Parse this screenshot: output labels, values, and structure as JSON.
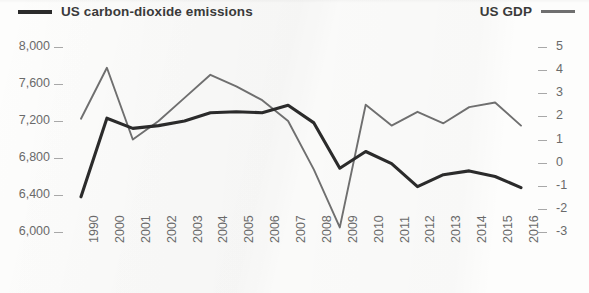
{
  "legend": {
    "left": {
      "label": "US carbon-dioxide emissions",
      "color": "#2b2b2b",
      "icon": "line-swatch-icon"
    },
    "right": {
      "label": "US GDP",
      "color": "#6f6f6f",
      "icon": "line-swatch-icon"
    }
  },
  "chart_data": {
    "type": "line",
    "title": "",
    "subtitle": "",
    "xlabel": "",
    "ylabel": "",
    "grid": false,
    "legend_position": "top",
    "categories": [
      "1990",
      "2000",
      "2001",
      "2002",
      "2003",
      "2004",
      "2005",
      "2006",
      "2007",
      "2008",
      "2009",
      "2010",
      "2011",
      "2012",
      "2013",
      "2014",
      "2015",
      "2016"
    ],
    "axes": {
      "left": {
        "name": "US carbon-dioxide emissions",
        "ticks": [
          "8,000",
          "7,600",
          "7,200",
          "6,800",
          "6,400",
          "6,000"
        ],
        "tick_values": [
          8000,
          7600,
          7200,
          6800,
          6400,
          6000
        ],
        "ylim": [
          6000,
          8000
        ]
      },
      "right": {
        "name": "US GDP",
        "ticks": [
          "5",
          "4",
          "3",
          "2",
          "1",
          "0",
          "-1",
          "-2",
          "-3"
        ],
        "tick_values": [
          5,
          4,
          3,
          2,
          1,
          0,
          -1,
          -2,
          -3
        ],
        "ylim": [
          -3,
          5
        ]
      }
    },
    "series": [
      {
        "name": "US carbon-dioxide emissions",
        "axis": "left",
        "color": "#2b2b2b",
        "values": [
          6380,
          7230,
          7120,
          7150,
          7200,
          7290,
          7300,
          7290,
          7370,
          7180,
          6690,
          6870,
          6740,
          6490,
          6620,
          6660,
          6600,
          6480
        ]
      },
      {
        "name": "US GDP",
        "axis": "right",
        "color": "#6f6f6f",
        "values": [
          1.9,
          4.1,
          1.0,
          1.8,
          2.8,
          3.8,
          3.3,
          2.7,
          1.8,
          -0.3,
          -2.8,
          2.5,
          1.6,
          2.2,
          1.7,
          2.4,
          2.6,
          1.6
        ]
      }
    ]
  }
}
